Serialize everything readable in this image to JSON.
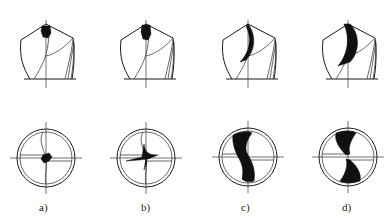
{
  "figure": {
    "panels": [
      {
        "id": "a",
        "label": "a)",
        "side_cx": 46,
        "end_cx": 46,
        "thinning": "small-tip"
      },
      {
        "id": "b",
        "label": "b)",
        "side_cx": 146,
        "end_cx": 146,
        "thinning": "short-notch"
      },
      {
        "id": "c",
        "label": "c)",
        "side_cx": 248,
        "end_cx": 248,
        "thinning": "long-S"
      },
      {
        "id": "d",
        "label": "d)",
        "side_cx": 348,
        "end_cx": 348,
        "thinning": "wide-S"
      }
    ],
    "colors": {
      "line": "#1a1a1a",
      "fill": "#111111",
      "background": "#ffffff"
    }
  }
}
